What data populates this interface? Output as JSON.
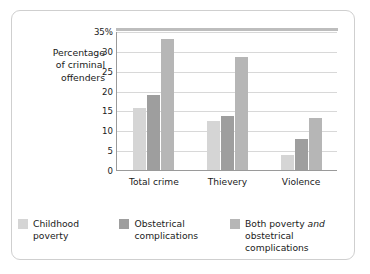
{
  "chart_data": {
    "type": "bar",
    "title": "",
    "xlabel": "",
    "ylabel": "Percentage of criminal offenders",
    "ylabel_lines": [
      "Percentage",
      "of criminal",
      "offenders"
    ],
    "categories": [
      "Total crime",
      "Thievery",
      "Violence"
    ],
    "series": [
      {
        "name": "Childhood poverty",
        "values": [
          15.7,
          12.3,
          3.8
        ],
        "color": "#d5d5d5"
      },
      {
        "name": "Obstetrical complications",
        "values": [
          19.0,
          13.5,
          7.8
        ],
        "color": "#9e9e9e"
      },
      {
        "name": "Both poverty and obstetrical complications",
        "values": [
          33.0,
          28.5,
          13.0
        ],
        "color": "#b6b6b6"
      }
    ],
    "ylim": [
      0,
      35
    ],
    "yticks": [
      0,
      5,
      10,
      15,
      20,
      25,
      30,
      35
    ],
    "ytick_labels": [
      "0",
      "5",
      "10",
      "15",
      "20",
      "25",
      "30",
      "35%"
    ],
    "grid": true,
    "legend_position": "bottom"
  },
  "legend": {
    "items": [
      {
        "line1": "Childhood",
        "line2": "poverty"
      },
      {
        "line1": "Obstetrical",
        "line2": "complications"
      },
      {
        "line1_a": "Both poverty ",
        "line1_em": "and",
        "line2": "obstetrical complications"
      }
    ]
  }
}
